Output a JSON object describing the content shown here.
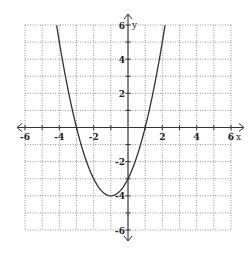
{
  "chart_data": {
    "type": "line",
    "title": "",
    "xlabel": "x",
    "ylabel": "y",
    "xlim": [
      -6,
      6
    ],
    "ylim": [
      -6,
      6
    ],
    "grid": true,
    "grid_style": "dotted",
    "grid_step": 1,
    "x_tick_labels": [
      "-6",
      "-4",
      "-2",
      "2",
      "4",
      "6"
    ],
    "x_tick_values": [
      -6,
      -4,
      -2,
      2,
      4,
      6
    ],
    "y_tick_labels": [
      "6",
      "4",
      "2",
      "-2",
      "-4",
      "-6"
    ],
    "y_tick_values": [
      6,
      4,
      2,
      -2,
      -4,
      -6
    ],
    "series": [
      {
        "name": "parabola",
        "equation": "y = x^2 + 2x - 3",
        "vertex": [
          -1,
          -4
        ],
        "x_intercepts": [
          -3,
          1
        ],
        "y_intercept": -3,
        "x": [
          -4.16,
          -4,
          -3,
          -2,
          -1,
          0,
          1,
          2,
          2.16
        ],
        "y": [
          6,
          5,
          0,
          -3,
          -4,
          -3,
          0,
          5,
          6
        ],
        "color": "#333333"
      }
    ],
    "legend": "none"
  }
}
